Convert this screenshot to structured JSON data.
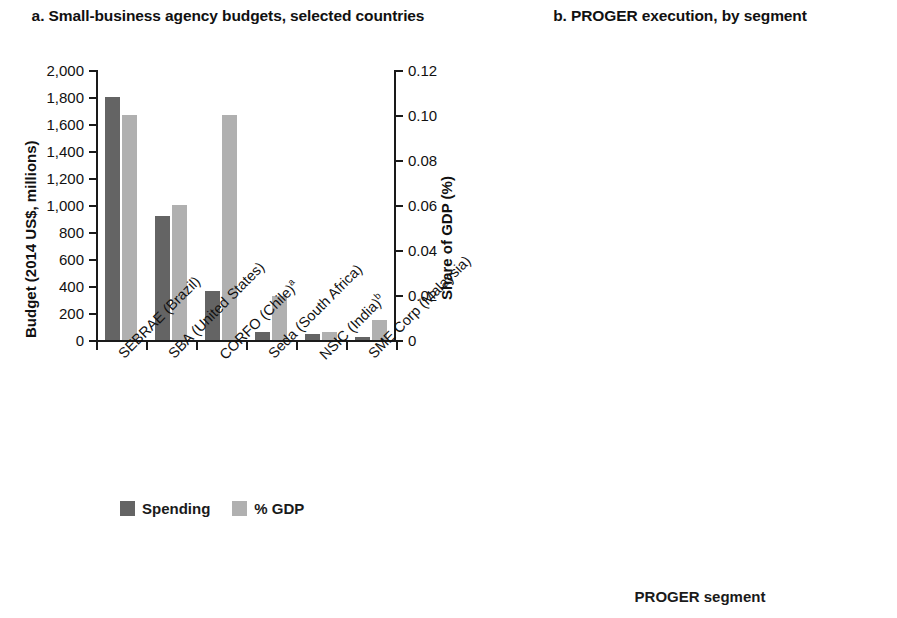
{
  "panel_a": {
    "title": "a. Small-business agency budgets, selected countries",
    "y_left_title": "Budget (2014 US$, millions)",
    "y_right_title": "Share of GDP (%)",
    "y_left_ticks": [
      "0",
      "200",
      "400",
      "600",
      "800",
      "1,000",
      "1,200",
      "1,400",
      "1,600",
      "1,800",
      "2,000"
    ],
    "y_right_ticks": [
      "0",
      "0.02",
      "0.04",
      "0.06",
      "0.08",
      "0.10",
      "0.12"
    ],
    "categories": [
      "SEBRAE (Brazil)",
      "SBA (United States)",
      "CORFO (Chile)",
      "Seda (South Africa)",
      "NSIC (India)",
      "SME Corp (Malaysia)"
    ],
    "category_markers": [
      "",
      "",
      "a",
      "",
      "b",
      ""
    ],
    "legend": [
      {
        "label": "Spending",
        "color": "#646464"
      },
      {
        "label": "% GDP",
        "color": "#b0b0b0"
      }
    ]
  },
  "panel_b": {
    "title": "b. PROGER execution, by segment",
    "y_title": "Expenditure (R$, millions)",
    "x_title": "PROGER segment",
    "y_ticks": [
      "0",
      "1,000",
      "2,000",
      "3,000",
      "4,000",
      "5,000",
      "6,000"
    ],
    "categories": [
      "Micro and small",
      "Medium and large",
      "Infrastructure investment",
      "Exports promotion",
      "Innovation and technology adoption",
      "Specific governmental initiatives"
    ]
  },
  "chart_data": [
    {
      "type": "bar",
      "title": "a. Small-business agency budgets, selected countries",
      "xlabel": "",
      "ylabel": "Budget (2014 US$, millions)",
      "y2label": "Share of GDP (%)",
      "ylim": [
        0,
        2000
      ],
      "y2lim": [
        0,
        0.12
      ],
      "ytick_step": 200,
      "y2tick_step": 0.02,
      "grid": false,
      "legend_position": "bottom-left",
      "categories": [
        "SEBRAE (Brazil)",
        "SBA (United States)",
        "CORFO (Chile)a",
        "Seda (South Africa)",
        "NSIC (India)b",
        "SME Corp (Malaysia)"
      ],
      "series": [
        {
          "name": "Spending",
          "axis": "left",
          "color": "#646464",
          "values": [
            1800,
            920,
            360,
            60,
            45,
            20
          ]
        },
        {
          "name": "% GDP",
          "axis": "right",
          "color": "#b0b0b0",
          "values": [
            0.1,
            0.06,
            0.1,
            0.0195,
            0.0035,
            0.009
          ]
        }
      ]
    },
    {
      "type": "bar",
      "title": "b. PROGER execution, by segment",
      "xlabel": "PROGER segment",
      "ylabel": "Expenditure (R$, millions)",
      "ylim": [
        0,
        6000
      ],
      "ytick_step": 1000,
      "grid": false,
      "legend_position": "none",
      "categories": [
        "Micro and small",
        "Medium and large",
        "Infrastructure investment",
        "Exports promotion",
        "Innovation and technology adoption",
        "Specific governmental initiatives"
      ],
      "values": [
        5600,
        830,
        790,
        0,
        0,
        210
      ],
      "color": "#b0b0b0"
    }
  ]
}
